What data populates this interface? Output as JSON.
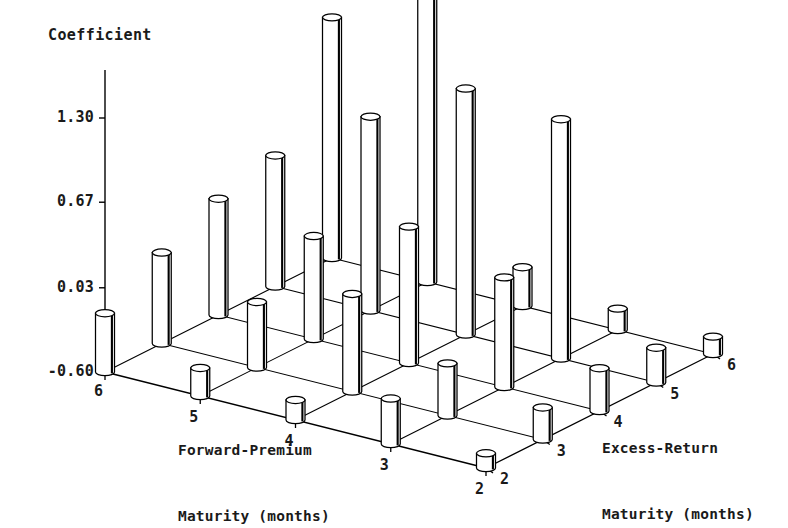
{
  "chart_data": {
    "type": "bar",
    "subtype": "3d-cylinder-surface-bars",
    "title": "Coefficient",
    "zlabel": "Coefficient",
    "xlabel": "Forward-Premium Maturity (months)",
    "ylabel": "Excess-Return Maturity (months)",
    "x_categories": [
      "6",
      "5",
      "4",
      "3",
      "2"
    ],
    "y_categories": [
      "2",
      "3",
      "4",
      "5",
      "6"
    ],
    "z_ticks": [
      "1.30",
      "0.67",
      "0.03",
      "-0.60"
    ],
    "z_tick_values": [
      1.3,
      0.67,
      0.03,
      -0.6
    ],
    "zlim": [
      -0.6,
      1.72
    ],
    "grid": true,
    "legend": "none",
    "series": [
      {
        "name": "Excess-Return Maturity 2",
        "y_category": "2",
        "categories": [
          "6",
          "5",
          "4",
          "3",
          "2"
        ],
        "values": [
          -0.16,
          -0.39,
          -0.45,
          -0.26,
          -0.49
        ]
      },
      {
        "name": "Excess-Return Maturity 3",
        "y_category": "3",
        "categories": [
          "6",
          "5",
          "4",
          "3",
          "2"
        ],
        "values": [
          0.08,
          -0.11,
          0.13,
          -0.21,
          -0.36
        ]
      },
      {
        "name": "Excess-Return Maturity 4",
        "y_category": "4",
        "categories": [
          "6",
          "5",
          "4",
          "3",
          "2"
        ],
        "values": [
          0.27,
          0.17,
          0.42,
          0.22,
          -0.28
        ]
      },
      {
        "name": "Excess-Return Maturity 5",
        "y_category": "5",
        "categories": [
          "6",
          "5",
          "4",
          "3",
          "2"
        ],
        "values": [
          0.38,
          0.85,
          1.24,
          1.19,
          -0.34
        ]
      },
      {
        "name": "Excess-Return Maturity 6",
        "y_category": "6",
        "categories": [
          "6",
          "5",
          "4",
          "3",
          "2"
        ],
        "values": [
          1.2,
          1.72,
          -0.31,
          -0.44,
          -0.47
        ]
      }
    ]
  },
  "labels": {
    "z_axis_title": "Coefficient",
    "x_axis_title_line1": "Forward-Premium",
    "x_axis_title_line2": "Maturity (months)",
    "y_axis_title_line1": "Excess-Return",
    "y_axis_title_line2": "Maturity (months)"
  },
  "colors": {
    "ink": "#000000",
    "bar_fill": "#ffffff",
    "bar_stroke": "#000000",
    "grid": "#000000",
    "background": "#ffffff"
  }
}
